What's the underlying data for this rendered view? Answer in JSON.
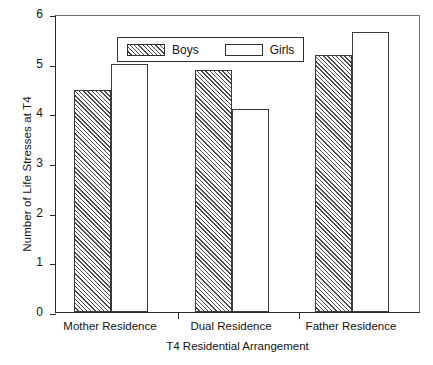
{
  "chart_data": {
    "type": "bar",
    "title": "",
    "xlabel": "T4 Residential Arrangement",
    "ylabel": "Number of Life Stresses at T4",
    "categories": [
      "Mother Residence",
      "Dual Residence",
      "Father Residence"
    ],
    "series": [
      {
        "name": "Boys",
        "values": [
          4.48,
          4.87,
          5.17
        ],
        "fill": "hatched"
      },
      {
        "name": "Girls",
        "values": [
          4.99,
          4.08,
          5.64
        ],
        "fill": "white"
      }
    ],
    "ylim": [
      0,
      6
    ],
    "yticks": [
      0,
      1,
      2,
      3,
      4,
      5,
      6
    ],
    "ytick_labels": [
      "0",
      "1",
      "2",
      "3",
      "4",
      "5",
      "6"
    ],
    "grid": false,
    "legend_position": "top-left",
    "legend_entries": [
      "Boys",
      "Girls"
    ],
    "colors": {
      "axis": "#2a2a2a",
      "bar_outline": "#3a3a3a",
      "hatch": "#4a4a4a",
      "background": "#ffffff",
      "text": "#141414"
    }
  }
}
